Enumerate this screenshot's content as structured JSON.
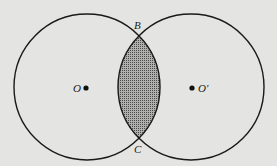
{
  "diagram": {
    "type": "two-intersecting-circles",
    "shaded_region": "lens (intersection of the two circles)",
    "labels": {
      "center_left": "O",
      "center_right": "O'",
      "top_intersection": "B",
      "bottom_intersection": "C"
    },
    "colors": {
      "background": "#e4e4e2",
      "stroke": "#1a1a1a",
      "shading": "#7a7a7a"
    }
  }
}
